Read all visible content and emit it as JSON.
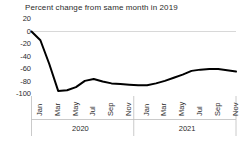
{
  "chart_data": {
    "type": "line",
    "title": "Percent change from same month in 2019",
    "xlabel": "",
    "ylabel": "",
    "ylim": [
      -100,
      20
    ],
    "yticks": [
      20,
      0,
      -20,
      -40,
      -60,
      -80,
      -100
    ],
    "ytick_labels": [
      "20",
      "0",
      "-20",
      "-40",
      "-60",
      "-80",
      "-100"
    ],
    "grid": true,
    "gridlines_at": [
      0
    ],
    "legend": "none",
    "line_color": "#000000",
    "groups": [
      {
        "label": "2020",
        "start_index": 0,
        "end_index": 11
      },
      {
        "label": "2021",
        "start_index": 12,
        "end_index": 23
      }
    ],
    "x": [
      "Jan 2020",
      "Feb 2020",
      "Mar 2020",
      "Apr 2020",
      "May 2020",
      "Jun 2020",
      "Jul 2020",
      "Aug 2020",
      "Sep 2020",
      "Oct 2020",
      "Nov 2020",
      "Dec 2020",
      "Jan 2021",
      "Feb 2021",
      "Mar 2021",
      "Apr 2021",
      "May 2021",
      "Jun 2021",
      "Jul 2021",
      "Aug 2021",
      "Sep 2021",
      "Oct 2021",
      "Nov 2021",
      "Dec 2021"
    ],
    "xtick_labels": [
      "Jan",
      "Mar",
      "May",
      "Jul",
      "Sep",
      "Nov",
      "Jan",
      "Mar",
      "May",
      "Jul",
      "Sep",
      "Nov"
    ],
    "xtick_indices": [
      0,
      2,
      4,
      6,
      8,
      10,
      12,
      14,
      16,
      18,
      20,
      22
    ],
    "values": [
      0,
      -14,
      -52,
      -95,
      -94,
      -89,
      -79,
      -76,
      -80,
      -83,
      -84,
      -85,
      -86,
      -86,
      -83,
      -79,
      -74,
      -69,
      -63,
      -61,
      -60,
      -60,
      -62,
      -64
    ],
    "series": [
      {
        "name": "Percent change from same month in 2019",
        "values": [
          0,
          -14,
          -52,
          -95,
          -94,
          -89,
          -79,
          -76,
          -80,
          -83,
          -84,
          -85,
          -86,
          -86,
          -83,
          -79,
          -74,
          -69,
          -63,
          -61,
          -60,
          -60,
          -62,
          -64
        ]
      }
    ]
  }
}
